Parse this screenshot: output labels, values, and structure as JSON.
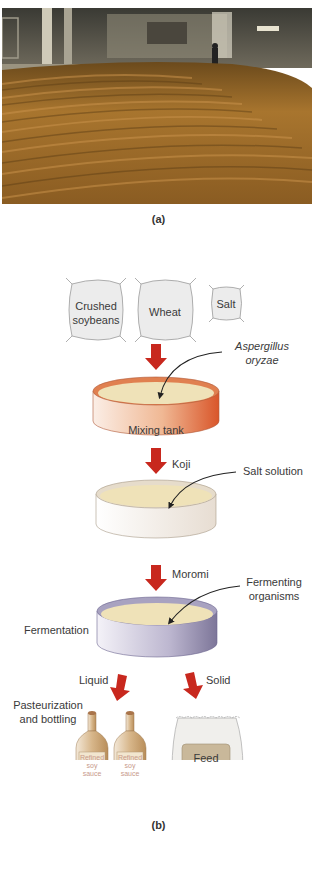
{
  "panel_a": {
    "caption": "(a)",
    "photo_description": "Koji fermentation room with soybean/wheat mash raked in curved rows"
  },
  "panel_b": {
    "caption": "(b)",
    "ingredients": [
      {
        "line1": "Crushed",
        "line2": "soybeans"
      },
      {
        "line1": "Wheat",
        "line2": ""
      },
      {
        "line1": "Salt",
        "line2": ""
      }
    ],
    "aspergillus": {
      "line1": "Aspergillus",
      "line2": "oryzae"
    },
    "mixing_tank": "Mixing tank",
    "koji": "Koji",
    "salt_solution": "Salt solution",
    "moromi": "Moromi",
    "fermenting": {
      "line1": "Fermenting",
      "line2": "organisms"
    },
    "fermentation": "Fermentation",
    "liquid": "Liquid",
    "solid": "Solid",
    "pasteurization": {
      "line1": "Pasteurization",
      "line2": "and bottling"
    },
    "bottle_label": {
      "line1": "Refined",
      "line2": "soy",
      "line3": "sauce"
    },
    "feed": "Feed"
  },
  "colors": {
    "arrow": "#c8281e",
    "mixing_tank_rim": "#d9622e",
    "mash": "#efe2b8",
    "fermentation_tank": "#8c86a8",
    "bag_fill": "#ededed",
    "bottle": "#c9a57a",
    "feed_label": "#c9b89a"
  }
}
